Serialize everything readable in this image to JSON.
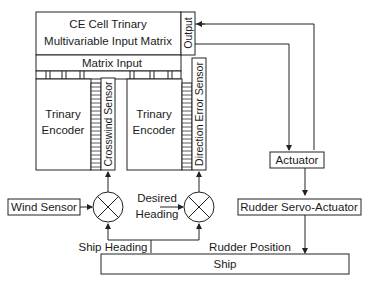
{
  "diagram": {
    "matrix": {
      "title_line1": "CE Cell Trinary",
      "title_line2": "Multivariable Input Matrix",
      "output_label": "Output",
      "input_label": "Matrix Input"
    },
    "encoders": [
      {
        "line1": "Trinary",
        "line2": "Encoder",
        "sensor": "Crosswind Sensor"
      },
      {
        "line1": "Trinary",
        "line2": "Encoder",
        "sensor": "Direction Error Sensor"
      }
    ],
    "wind_sensor": "Wind Sensor",
    "desired_heading_line1": "Desired",
    "desired_heading_line2": "Heading",
    "ship_heading": "Ship Heading",
    "rudder_position": "Rudder Position",
    "actuator": "Actuator",
    "rudder_servo": "Rudder Servo-Actuator",
    "ship": "Ship"
  }
}
